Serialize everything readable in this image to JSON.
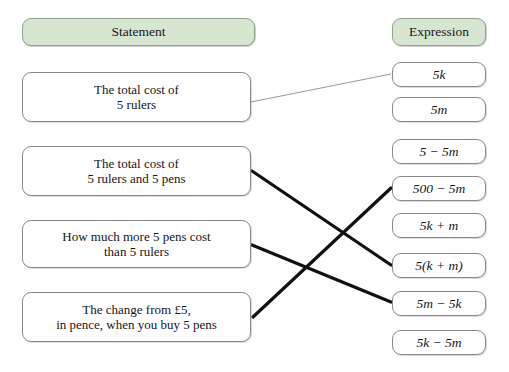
{
  "headers": {
    "left": "Statement",
    "right": "Expression"
  },
  "statements": [
    {
      "id": "stmt-1",
      "line1": "The total cost of",
      "line2": "5 rulers"
    },
    {
      "id": "stmt-2",
      "line1": "The total cost of",
      "line2": "5 rulers and 5 pens"
    },
    {
      "id": "stmt-3",
      "line1": "How much more 5 pens cost",
      "line2": "than 5 rulers"
    },
    {
      "id": "stmt-4",
      "line1": "The change from £5,",
      "line2": "in pence, when you buy 5 pens"
    }
  ],
  "expressions": [
    {
      "id": "expr-1",
      "text": "5k"
    },
    {
      "id": "expr-2",
      "text": "5m"
    },
    {
      "id": "expr-3",
      "text": "5 − 5m"
    },
    {
      "id": "expr-4",
      "text": "500 − 5m"
    },
    {
      "id": "expr-5",
      "text": "5k + m"
    },
    {
      "id": "expr-6",
      "text": "5(k + m)"
    },
    {
      "id": "expr-7",
      "text": "5m − 5k"
    },
    {
      "id": "expr-8",
      "text": "5k − 5m"
    }
  ],
  "connections": [
    {
      "id": "link-1",
      "from": "stmt-1",
      "to": "expr-1",
      "style": "thin",
      "color": "#9a9a9a"
    },
    {
      "id": "link-2",
      "from": "stmt-2",
      "to": "expr-6",
      "style": "thick",
      "color": "#111111"
    },
    {
      "id": "link-3",
      "from": "stmt-3",
      "to": "expr-7",
      "style": "thick",
      "color": "#111111"
    },
    {
      "id": "link-4",
      "from": "stmt-4",
      "to": "expr-4",
      "style": "thick",
      "color": "#111111"
    }
  ],
  "colors": {
    "header_fill": "#d7e6d1",
    "header_border": "#8fa38a",
    "node_border": "#8a8a8a",
    "page_background": "#ffffff",
    "thin_line": "#9a9a9a",
    "thick_line": "#111111"
  }
}
